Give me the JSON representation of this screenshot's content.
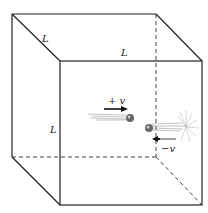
{
  "diagram": {
    "labels": {
      "edge_depth": "L",
      "edge_top": "L",
      "edge_height": "L",
      "velocity_pos": "+ v",
      "velocity_neg": "−v"
    },
    "colors": {
      "line": "#222222",
      "dashed": "#444444",
      "ball": "#555555"
    }
  }
}
